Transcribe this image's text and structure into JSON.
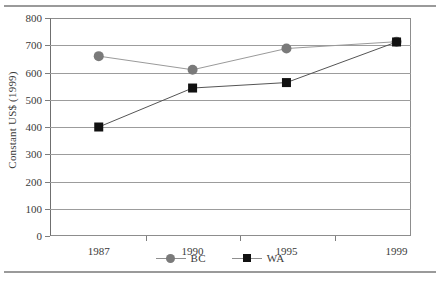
{
  "chart_data": {
    "type": "line",
    "title": "",
    "xlabel": "",
    "ylabel": "Constant US$ (1999)",
    "categories": [
      "1987",
      "1990",
      "1995",
      "1999"
    ],
    "ylim": [
      0,
      800
    ],
    "yticks": [
      0,
      100,
      200,
      300,
      400,
      500,
      600,
      700,
      800
    ],
    "ytick_labels": [
      "0",
      "100",
      "200",
      "300",
      "400",
      "500",
      "600",
      "700",
      "800"
    ],
    "grid": true,
    "legend_position": "bottom-center",
    "series": [
      {
        "name": "BC",
        "marker": "circle",
        "color": "#7a7a7a",
        "line_color": "#9a9a9a",
        "values": [
          660,
          610,
          688,
          713
        ]
      },
      {
        "name": "WA",
        "marker": "square",
        "color": "#111111",
        "line_color": "#555555",
        "values": [
          400,
          543,
          563,
          712
        ]
      }
    ]
  },
  "legend": {
    "items": [
      {
        "label": "BC"
      },
      {
        "label": "WA"
      }
    ]
  },
  "axes": {
    "y_title": "Constant US$ (1999)"
  },
  "colors": {
    "bc": "#7a7a7a",
    "wa": "#111111",
    "grid": "#9c9c9c",
    "frame": "#8d8d8d",
    "rule": "#9a9a9a"
  }
}
